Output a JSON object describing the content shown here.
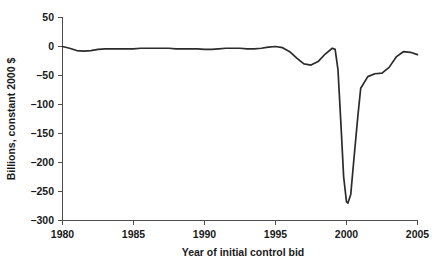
{
  "chart_data": {
    "type": "line",
    "title": "",
    "xlabel": "Year of initial control bid",
    "ylabel": "Billions, constant 2000 $",
    "xlim": [
      1980,
      2005
    ],
    "ylim": [
      -300,
      50
    ],
    "xticks": [
      1980,
      1985,
      1990,
      1995,
      2000,
      2005
    ],
    "xtick_labels": [
      "1980",
      "1985",
      "1990",
      "1995",
      "2000",
      "2005"
    ],
    "yticks": [
      50,
      0,
      -50,
      -100,
      -150,
      -200,
      -250,
      -300
    ],
    "ytick_labels": [
      "50",
      "0",
      "–50",
      "–100",
      "–150",
      "–200",
      "–250",
      "–300"
    ],
    "grid": false,
    "legend": false,
    "legend_position": "none",
    "line_color": "#2b2b2b",
    "series": [
      {
        "name": "Aggregate acquirer returns",
        "x": [
          1980,
          1980.5,
          1981,
          1981.5,
          1982,
          1982.5,
          1983,
          1983.5,
          1984,
          1984.5,
          1985,
          1985.5,
          1986,
          1986.5,
          1987,
          1987.5,
          1988,
          1988.5,
          1989,
          1989.5,
          1990,
          1990.5,
          1991,
          1991.5,
          1992,
          1992.5,
          1993,
          1993.5,
          1994,
          1994.5,
          1995,
          1995.5,
          1996,
          1996.5,
          1997,
          1997.5,
          1998,
          1998.5,
          1999,
          1999.2,
          1999.4,
          1999.6,
          1999.8,
          2000,
          2000.1,
          2000.3,
          2000.5,
          2000.8,
          2001,
          2001.5,
          2002,
          2002.5,
          2003,
          2003.5,
          2004,
          2004.5,
          2005
        ],
        "y": [
          0,
          -3,
          -7,
          -8,
          -7,
          -5,
          -4,
          -4,
          -4,
          -4,
          -4,
          -3,
          -3,
          -3,
          -3,
          -3,
          -4,
          -4,
          -4,
          -4,
          -5,
          -5,
          -4,
          -3,
          -3,
          -3,
          -4,
          -4,
          -3,
          -1,
          0,
          -2,
          -9,
          -20,
          -30,
          -32,
          -26,
          -13,
          -3,
          -5,
          -40,
          -130,
          -225,
          -268,
          -270,
          -255,
          -200,
          -120,
          -72,
          -52,
          -47,
          -46,
          -36,
          -18,
          -9,
          -10,
          -14
        ]
      }
    ],
    "annotations": []
  },
  "figure": {
    "background_color": "#ffffff",
    "axis_color": "#4d4d4d",
    "text_color": "#1a1a1a"
  }
}
